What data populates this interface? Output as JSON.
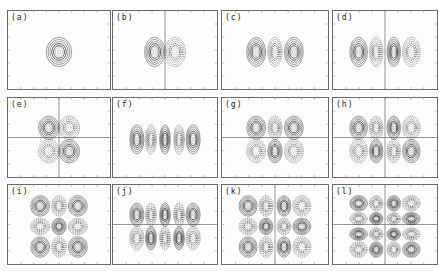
{
  "figure": {
    "panels": [
      {
        "id": "a",
        "label": "(a)",
        "nx": 1,
        "ny": 1,
        "vline": false,
        "hline": false
      },
      {
        "id": "b",
        "label": "(b)",
        "nx": 2,
        "ny": 1,
        "vline": true,
        "hline": false
      },
      {
        "id": "c",
        "label": "(c)",
        "nx": 3,
        "ny": 1,
        "vline": false,
        "hline": false
      },
      {
        "id": "d",
        "label": "(d)",
        "nx": 4,
        "ny": 1,
        "vline": true,
        "hline": false
      },
      {
        "id": "e",
        "label": "(e)",
        "nx": 2,
        "ny": 2,
        "vline": true,
        "hline": true
      },
      {
        "id": "f",
        "label": "(f)",
        "nx": 5,
        "ny": 1,
        "vline": false,
        "hline": false
      },
      {
        "id": "g",
        "label": "(g)",
        "nx": 3,
        "ny": 2,
        "vline": false,
        "hline": true
      },
      {
        "id": "h",
        "label": "(h)",
        "nx": 4,
        "ny": 2,
        "vline": true,
        "hline": true
      },
      {
        "id": "i",
        "label": "(i)",
        "nx": 3,
        "ny": 3,
        "vline": false,
        "hline": false
      },
      {
        "id": "j",
        "label": "(j)",
        "nx": 5,
        "ny": 2,
        "vline": false,
        "hline": true
      },
      {
        "id": "k",
        "label": "(k)",
        "nx": 4,
        "ny": 3,
        "vline": true,
        "hline": false
      },
      {
        "id": "l",
        "label": "(l)",
        "nx": 4,
        "ny": 4,
        "vline": true,
        "hline": true
      }
    ]
  }
}
